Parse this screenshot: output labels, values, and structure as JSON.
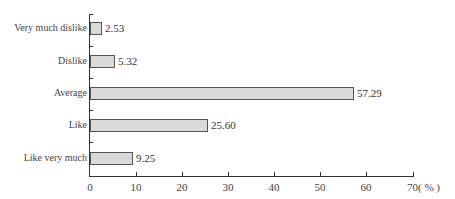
{
  "chart_data": {
    "type": "bar",
    "orientation": "horizontal",
    "title": "",
    "xlabel": "(%)",
    "ylabel": "",
    "categories": [
      "Very much dislike",
      "Dislike",
      "Average",
      "Like",
      "Like very much"
    ],
    "values": [
      2.53,
      5.32,
      57.29,
      25.6,
      9.25
    ],
    "value_labels": [
      "2.53",
      "5.32",
      "57.29",
      "25.60",
      "9.25"
    ],
    "xlim": [
      0,
      70
    ],
    "xticks": [
      "0",
      "10",
      "20",
      "30",
      "40",
      "50",
      "60",
      "70( % )"
    ],
    "grid": false,
    "legend": null,
    "bar_color": "#d9d9d9",
    "bar_edge_color": "#555555"
  }
}
